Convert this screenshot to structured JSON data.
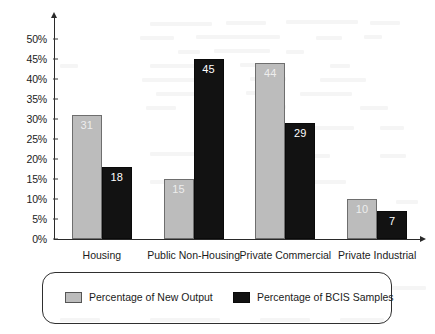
{
  "chart_data": {
    "type": "bar",
    "title": "",
    "subtitle": "",
    "xlabel": "",
    "ylabel": "",
    "categories": [
      "Housing",
      "Public Non-Housing",
      "Private Commercial",
      "Private Industrial"
    ],
    "series": [
      {
        "name": "Percentage of New Output",
        "color": "#bcbcbc",
        "values": [
          31,
          15,
          44,
          10
        ]
      },
      {
        "name": "Percentage of BCIS Samples",
        "color": "#121212",
        "values": [
          18,
          45,
          29,
          7
        ]
      }
    ],
    "ylim": [
      0,
      50
    ],
    "ytick_values": [
      0,
      5,
      10,
      15,
      20,
      25,
      30,
      35,
      40,
      45,
      50
    ],
    "ytick_labels": [
      "0%",
      "5%",
      "10%",
      "15%",
      "20%",
      "25%",
      "30%",
      "35%",
      "40%",
      "45%",
      "50%"
    ],
    "value_labels_shown": true,
    "grid": false,
    "legend_position": "bottom",
    "axis_arrows": true
  },
  "legend": {
    "items": [
      {
        "label": "Percentage of New Output",
        "swatch": "grey"
      },
      {
        "label": "Percentage of BCIS Samples",
        "swatch": "black"
      }
    ]
  }
}
